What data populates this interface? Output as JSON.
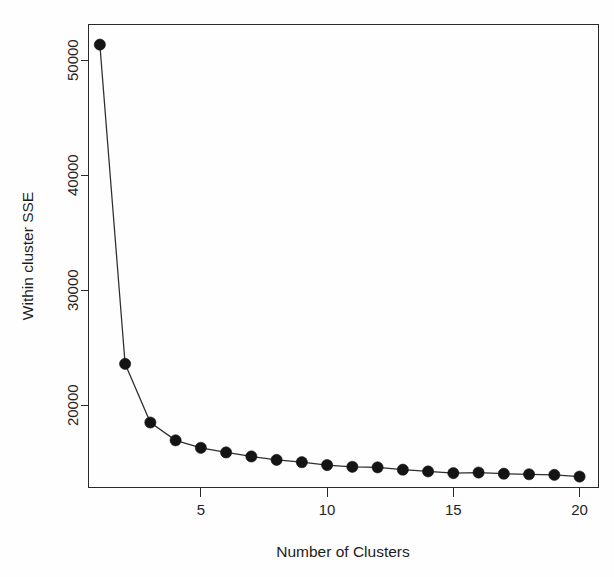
{
  "chart_data": {
    "type": "line",
    "title": "",
    "subtitle": "",
    "xlabel": "Number of Clusters",
    "ylabel": "Within cluster SSE",
    "x": [
      1,
      2,
      3,
      4,
      5,
      6,
      7,
      8,
      9,
      10,
      11,
      12,
      13,
      14,
      15,
      16,
      17,
      18,
      19,
      20
    ],
    "values": [
      51350,
      23600,
      18500,
      16950,
      16300,
      15900,
      15550,
      15250,
      15050,
      14800,
      14650,
      14600,
      14400,
      14250,
      14100,
      14150,
      14050,
      14000,
      13950,
      13800
    ],
    "series": [
      {
        "name": "Within cluster SSE",
        "values": [
          51350,
          23600,
          18500,
          16950,
          16300,
          15900,
          15550,
          15250,
          15050,
          14800,
          14650,
          14600,
          14400,
          14250,
          14100,
          14150,
          14050,
          14000,
          13950,
          13800
        ]
      }
    ],
    "xticks": [
      5,
      10,
      15,
      20
    ],
    "xtick_labels": [
      "5",
      "10",
      "15",
      "20"
    ],
    "yticks": [
      20000,
      30000,
      40000,
      50000
    ],
    "ytick_labels": [
      "20000",
      "30000",
      "40000",
      "50000"
    ],
    "xlim": [
      0.55,
      20.75
    ],
    "ylim": [
      12850,
      53100
    ],
    "grid": false,
    "legend": false,
    "legend_position": "none",
    "marker": "filled-circle",
    "line_style": "solid",
    "series_color": "#141414",
    "axis_color": "#2a2a2a",
    "background_color": "#ffffff",
    "frame": "box",
    "annotations": []
  },
  "figure": {
    "name": "elbow-plot",
    "y_axis_title": "Within cluster SSE",
    "x_axis_title": "Number of Clusters"
  }
}
